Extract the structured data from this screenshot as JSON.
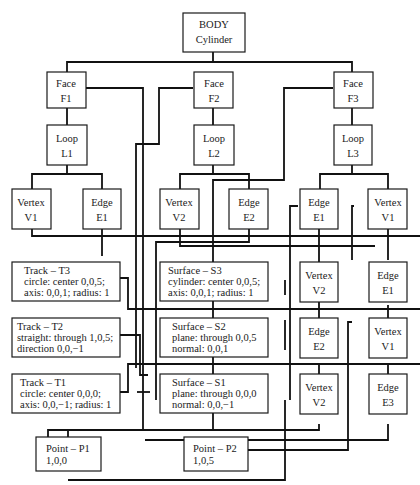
{
  "diagram": {
    "nodes": {
      "body": {
        "line1": "BODY",
        "line2": "Cylinder"
      },
      "f1": {
        "line1": "Face",
        "line2": "F1"
      },
      "f2": {
        "line1": "Face",
        "line2": "F2"
      },
      "f3": {
        "line1": "Face",
        "line2": "F3"
      },
      "l1": {
        "line1": "Loop",
        "line2": "L1"
      },
      "l2": {
        "line1": "Loop",
        "line2": "L2"
      },
      "l3": {
        "line1": "Loop",
        "line2": "L3"
      },
      "l1_v1": {
        "line1": "Vertex",
        "line2": "V1"
      },
      "l1_e1": {
        "line1": "Edge",
        "line2": "E1"
      },
      "l2_v2": {
        "line1": "Vertex",
        "line2": "V2"
      },
      "l2_e2": {
        "line1": "Edge",
        "line2": "E2"
      },
      "l3_e1": {
        "line1": "Edge",
        "line2": "E1"
      },
      "l3_v1": {
        "line1": "Vertex",
        "line2": "V1"
      },
      "c1_v2": {
        "line1": "Vertex",
        "line2": "V2"
      },
      "c1_e2": {
        "line1": "Edge",
        "line2": "E2"
      },
      "c1_v2b": {
        "line1": "Vertex",
        "line2": "V2"
      },
      "c2_e1": {
        "line1": "Edge",
        "line2": "E1"
      },
      "c2_v1": {
        "line1": "Vertex",
        "line2": "V1"
      },
      "c2_e3": {
        "line1": "Edge",
        "line2": "E3"
      },
      "t3": {
        "line1": "Track – T3",
        "line2": "circle:  center 0,0,5;",
        "line3": "axis:  0,0,1; radius:  1"
      },
      "t2": {
        "line1": "Track – T2",
        "line2": "straight:  through 1,0,5;",
        "line3": "direction 0,0,−1"
      },
      "t1": {
        "line1": "Track – T1",
        "line2": "circle:  center 0,0,0;",
        "line3": "axis:  0,0,−1; radius:  1"
      },
      "s3": {
        "line1": "Surface – S3",
        "line2": "cylinder:  center 0,0,5;",
        "line3": "axis:  0,0,1; radius:  1"
      },
      "s2": {
        "line1": "Surface – S2",
        "line2": "plane:  through 0,0,5",
        "line3": "normal:  0,0,1"
      },
      "s1": {
        "line1": "Surface – S1",
        "line2": "plane:  through 0,0,0",
        "line3": "normal:  0,0,−1"
      },
      "p1": {
        "line1": "Point – P1",
        "line2": "1,0,0"
      },
      "p2": {
        "line1": "Point – P2",
        "line2": "1,0,5"
      }
    },
    "colors": {
      "line": "#111111",
      "background": "#ffffff"
    }
  }
}
